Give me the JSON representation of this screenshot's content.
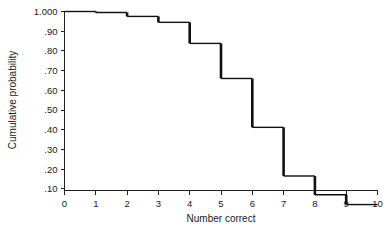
{
  "chart_data": {
    "type": "line",
    "title": "",
    "subtitle": "",
    "xlabel": "Number correct",
    "ylabel": "Cumulative probability",
    "xlim": [
      0,
      10
    ],
    "ylim": [
      0,
      1
    ],
    "grid": false,
    "legend": null,
    "annotations": [],
    "style": "step-function (right-continuous descending staircase)",
    "x_tick_labels": [
      "0",
      "1",
      "2",
      "3",
      "4",
      "5",
      "6",
      "7",
      "8",
      "9",
      "10"
    ],
    "x_tick_values": [
      0,
      1,
      2,
      3,
      4,
      5,
      6,
      7,
      8,
      9,
      10
    ],
    "y_tick_labels": [
      "1.000",
      ".90",
      ".80",
      ".70",
      ".60",
      ".50",
      ".40",
      ".30",
      ".20",
      ".10"
    ],
    "y_tick_values": [
      1.0,
      0.9,
      0.8,
      0.7,
      0.6,
      0.5,
      0.4,
      0.3,
      0.2,
      0.1
    ],
    "x": [
      0,
      1,
      2,
      3,
      4,
      5,
      6,
      7,
      8,
      9,
      10
    ],
    "values": [
      1.0,
      0.995,
      0.975,
      0.945,
      0.838,
      0.66,
      0.412,
      0.165,
      0.07,
      0.02,
      0.02
    ],
    "series": [
      {
        "name": "Cumulative probability",
        "color": "#111111",
        "points": [
          {
            "x_start": 0,
            "x_end": 1,
            "y": 1.0
          },
          {
            "x_start": 1,
            "x_end": 2,
            "y": 0.995
          },
          {
            "x_start": 2,
            "x_end": 3,
            "y": 0.975
          },
          {
            "x_start": 3,
            "x_end": 4,
            "y": 0.945
          },
          {
            "x_start": 4,
            "x_end": 5,
            "y": 0.838
          },
          {
            "x_start": 5,
            "x_end": 6,
            "y": 0.66
          },
          {
            "x_start": 6,
            "x_end": 7,
            "y": 0.412
          },
          {
            "x_start": 7,
            "x_end": 8,
            "y": 0.165
          },
          {
            "x_start": 8,
            "x_end": 9,
            "y": 0.07
          },
          {
            "x_start": 9,
            "x_end": 10,
            "y": 0.02
          }
        ]
      }
    ]
  },
  "axes": {
    "x_title": "Number correct",
    "y_title": "Cumulative probability"
  },
  "colors": {
    "line": "#111111",
    "axis": "#222222",
    "text": "#1a1a1a",
    "background": "#ffffff"
  }
}
